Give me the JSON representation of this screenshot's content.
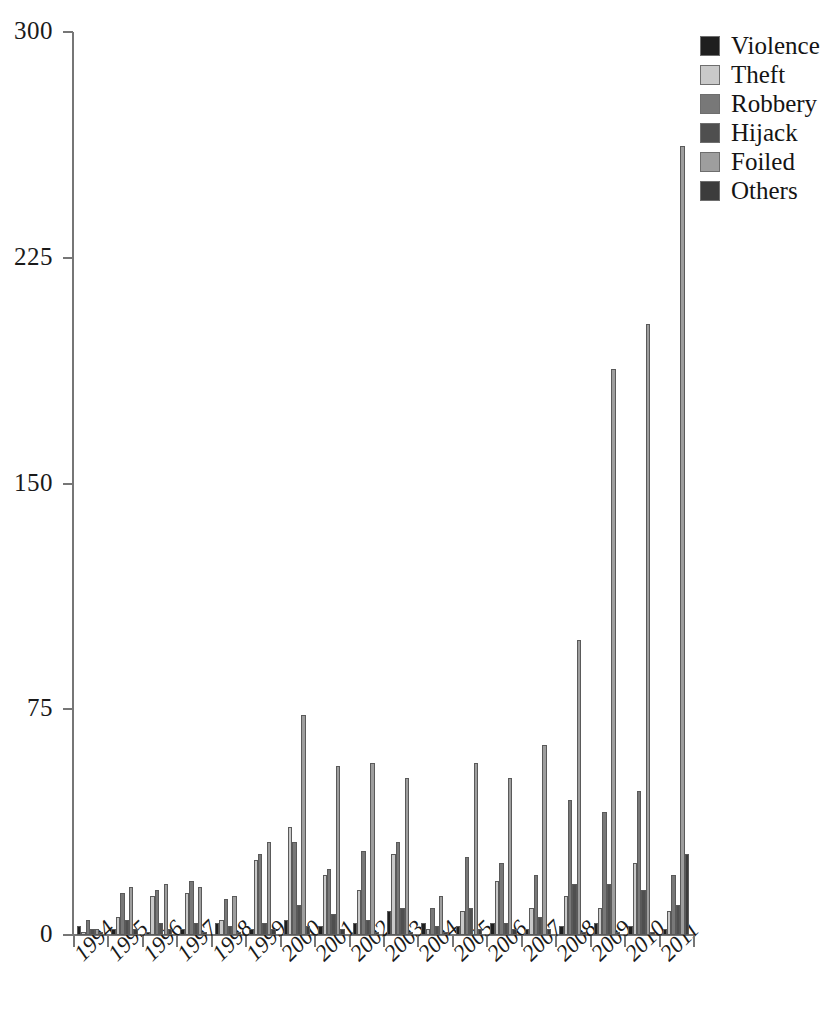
{
  "chart_data": {
    "type": "bar",
    "title": "",
    "subtitle": "",
    "xlabel": "",
    "ylabel": "",
    "ylim": [
      0,
      300
    ],
    "yticks": [
      0,
      75,
      150,
      225,
      300
    ],
    "grid": false,
    "legend_position": "top-right",
    "categories": [
      "1994",
      "1995",
      "1996",
      "1997",
      "1998",
      "1999",
      "2000",
      "2001",
      "2002",
      "2003",
      "2004",
      "2005",
      "2006",
      "2007",
      "2008",
      "2009",
      "2010",
      "2011"
    ],
    "series": [
      {
        "name": "Violence",
        "color": "#1f1f1f",
        "values": [
          3,
          2,
          1,
          2,
          4,
          2,
          5,
          3,
          4,
          8,
          4,
          3,
          4,
          2,
          3,
          4,
          3,
          2
        ]
      },
      {
        "name": "Theft",
        "color": "#c9c9c9",
        "values": [
          1,
          6,
          13,
          14,
          5,
          25,
          36,
          20,
          15,
          27,
          2,
          8,
          18,
          9,
          13,
          9,
          24,
          8
        ]
      },
      {
        "name": "Robbery",
        "color": "#787878",
        "values": [
          5,
          14,
          15,
          18,
          12,
          27,
          31,
          22,
          28,
          31,
          9,
          26,
          24,
          20,
          45,
          41,
          48,
          20
        ]
      },
      {
        "name": "Hijack",
        "color": "#4f4f4f",
        "values": [
          2,
          5,
          4,
          4,
          3,
          4,
          10,
          7,
          5,
          9,
          3,
          9,
          4,
          6,
          17,
          17,
          15,
          10
        ]
      },
      {
        "name": "Foiled",
        "color": "#9e9e9e",
        "values": [
          2,
          16,
          17,
          16,
          13,
          31,
          73,
          56,
          57,
          52,
          13,
          57,
          52,
          63,
          98,
          188,
          203,
          262
        ]
      },
      {
        "name": "Others",
        "color": "#3c3c3c",
        "values": [
          1,
          2,
          2,
          1,
          1,
          2,
          3,
          2,
          1,
          1,
          1,
          2,
          2,
          2,
          1,
          1,
          1,
          27
        ]
      }
    ]
  },
  "legend": {
    "items": [
      {
        "label": "Violence",
        "color": "#1f1f1f"
      },
      {
        "label": "Theft",
        "color": "#c9c9c9"
      },
      {
        "label": "Robbery",
        "color": "#787878"
      },
      {
        "label": "Hijack",
        "color": "#4f4f4f"
      },
      {
        "label": "Foiled",
        "color": "#9e9e9e"
      },
      {
        "label": "Others",
        "color": "#3c3c3c"
      }
    ]
  },
  "axes": {
    "y_tick_labels": [
      "0",
      "75",
      "150",
      "225",
      "300"
    ],
    "x_tick_labels": [
      "1994",
      "1995",
      "1996",
      "1997",
      "1998",
      "1999",
      "2000",
      "2001",
      "2002",
      "2003",
      "2004",
      "2005",
      "2006",
      "2007",
      "2008",
      "2009",
      "2010",
      "2011"
    ],
    "axis_color": "#767676"
  }
}
